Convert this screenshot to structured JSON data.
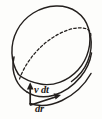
{
  "figure": {
    "background_color": "#fdfdfb",
    "ink_color": "#231f1d",
    "labels": {
      "velocity_time": "v dt",
      "velocity_time_parts": {
        "symbol": "v",
        "differential": "dt"
      },
      "radial_displacement": "dr",
      "radial_displacement_parts": {
        "differential": "d",
        "symbol": "r"
      }
    },
    "vectors": [
      {
        "name": "v-dt-vector",
        "label": "v dt",
        "direction": "up",
        "tail": {
          "x": 30,
          "y": 104
        },
        "tip": {
          "x": 30,
          "y": 84
        }
      },
      {
        "name": "dr-vector",
        "label": "dr",
        "direction": "right-up",
        "tail": {
          "x": 31,
          "y": 105
        },
        "tip": {
          "x": 62,
          "y": 95
        }
      }
    ],
    "shapes": [
      {
        "name": "top-ellipse-rim",
        "style": "solid",
        "description": "outer tilted ellipse, top face"
      },
      {
        "name": "bottom-ellipse-front-rim",
        "style": "solid",
        "description": "front lower rim of disc"
      },
      {
        "name": "bottom-ellipse-hidden-rim",
        "style": "dashed",
        "description": "hidden far rim of lower face"
      },
      {
        "name": "left-side-wall",
        "style": "solid",
        "description": "left thickness edge"
      },
      {
        "name": "right-side-wall",
        "style": "solid",
        "description": "right thickness edge"
      }
    ]
  }
}
